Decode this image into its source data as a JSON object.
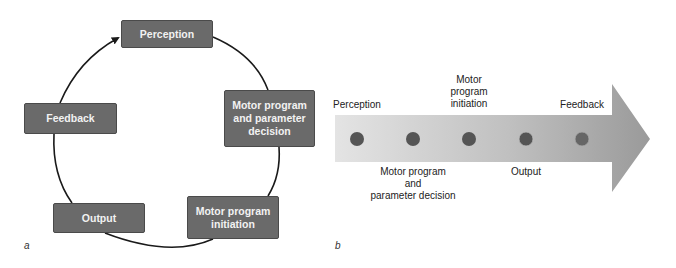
{
  "panel_a": {
    "label": "a",
    "type": "cycle",
    "nodes": [
      {
        "id": "perception",
        "text": "Perception"
      },
      {
        "id": "motor-program-decision",
        "text": "Motor program\nand parameter\ndecision"
      },
      {
        "id": "motor-program-initiation",
        "text": "Motor program\ninitiation"
      },
      {
        "id": "output",
        "text": "Output"
      },
      {
        "id": "feedback",
        "text": "Feedback"
      }
    ],
    "flow": "clockwise, arrow from Feedback back to Perception"
  },
  "panel_b": {
    "label": "b",
    "type": "linear-arrow",
    "stages": [
      {
        "id": "perception",
        "text": "Perception",
        "position": "above"
      },
      {
        "id": "motor-program-decision",
        "text": "Motor program\nand\nparameter decision",
        "position": "below"
      },
      {
        "id": "motor-program-initiation",
        "text": "Motor\nprogram\ninitiation",
        "position": "above"
      },
      {
        "id": "output",
        "text": "Output",
        "position": "below"
      },
      {
        "id": "feedback",
        "text": "Feedback",
        "position": "above"
      }
    ]
  },
  "colors": {
    "box_fill": "#6a6a6a",
    "box_border": "#4a4a4a",
    "box_text": "#f2f2f2",
    "arrow_light": "#e2e2e2",
    "arrow_dark": "#9a9a9a",
    "dot": "#555555"
  }
}
